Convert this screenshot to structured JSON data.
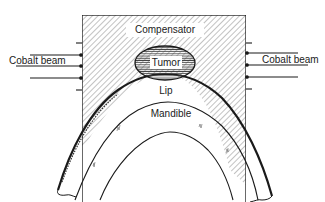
{
  "diagram": {
    "type": "anatomical-schematic",
    "labels": {
      "compensator": "Compensator",
      "tumor": "Tumor",
      "lip": "Lip",
      "mandible": "Mandible",
      "beam_left": "Cobalt beam",
      "beam_right": "Cobalt beam"
    },
    "colors": {
      "line": "#1a1a1a",
      "hatch": "#555555",
      "background": "#ffffff"
    }
  }
}
